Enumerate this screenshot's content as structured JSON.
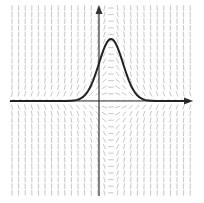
{
  "figure": {
    "title": "",
    "width": 204,
    "height": 203
  },
  "axes": {
    "origin_px": [
      99,
      101
    ],
    "x_axis": {
      "from_px": 10,
      "to_px": 193,
      "y_px": 101,
      "arrow": true
    },
    "y_axis": {
      "from_px": 196,
      "to_px": 5,
      "x_px": 99,
      "arrow": true
    },
    "color": "#333333"
  },
  "slope_field": {
    "equation": "dy/dx = -2(x - a)·y",
    "grid": {
      "x_start": 12,
      "x_end": 194,
      "y_start": 8,
      "y_end": 196,
      "dx": 6.6,
      "dy": 6.6
    },
    "segment_length": 5.5,
    "color": "#b8b8b8"
  },
  "solution_curve": {
    "type": "gaussian",
    "peak_px": [
      111,
      39
    ],
    "baseline_px": 101,
    "spread_px": 17,
    "x_from_px": 10,
    "x_to_px": 190,
    "color": "#222222",
    "stroke_width": 2
  },
  "chart_data": {
    "type": "line",
    "title": "",
    "xlabel": "",
    "ylabel": "",
    "series": [
      {
        "name": "solution curve",
        "function": "y = A·exp(-((x - a)/s)^2)",
        "peak_x_offset_from_axis": 12,
        "peak_height": 62
      }
    ],
    "grid": false,
    "legend": "none"
  }
}
